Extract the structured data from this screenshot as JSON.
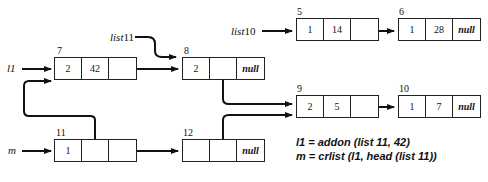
{
  "diagram": {
    "type": "linked-list-memory",
    "nodes": [
      {
        "id": "n5",
        "address": "5",
        "cells": [
          "1",
          "14",
          ""
        ],
        "x": 296,
        "y": 18
      },
      {
        "id": "n6",
        "address": "6",
        "cells": [
          "1",
          "28",
          "null"
        ],
        "x": 398,
        "y": 18
      },
      {
        "id": "n7",
        "address": "7",
        "cells": [
          "2",
          "42",
          ""
        ],
        "x": 54,
        "y": 57
      },
      {
        "id": "n8",
        "address": "8",
        "cells": [
          "2",
          "",
          "null"
        ],
        "x": 182,
        "y": 57
      },
      {
        "id": "n9",
        "address": "9",
        "cells": [
          "2",
          "5",
          ""
        ],
        "x": 296,
        "y": 95
      },
      {
        "id": "n10",
        "address": "10",
        "cells": [
          "1",
          "7",
          "null"
        ],
        "x": 398,
        "y": 95
      },
      {
        "id": "n11",
        "address": "11",
        "cells": [
          "1",
          "",
          ""
        ],
        "x": 54,
        "y": 139
      },
      {
        "id": "n12",
        "address": "12",
        "cells": [
          "",
          "",
          "null"
        ],
        "x": 182,
        "y": 139
      }
    ],
    "variables": [
      {
        "id": "l1",
        "label": "l1",
        "points_to": "n7"
      },
      {
        "id": "m",
        "label": "m",
        "points_to": "n11"
      },
      {
        "id": "list11",
        "label": "list11",
        "points_to": "n8"
      },
      {
        "id": "list10",
        "label": "list10",
        "points_to": "n5"
      }
    ],
    "edges": [
      {
        "from": "n5.next",
        "to": "n6"
      },
      {
        "from": "n7.next",
        "to": "n8"
      },
      {
        "from": "n8.data",
        "to": "n9"
      },
      {
        "from": "n9.next",
        "to": "n10"
      },
      {
        "from": "n11.data",
        "to": "n7"
      },
      {
        "from": "n11.next",
        "to": "n12"
      },
      {
        "from": "n12.data",
        "to": "n9"
      }
    ],
    "equations": [
      "l1 = addon (list 11, 42)",
      "m = crlist (l1, head (list 11))"
    ],
    "labels": {
      "l1": "l1",
      "m": "m",
      "list11": "list",
      "list11_num": "11",
      "list10": "list",
      "list10_num": "10"
    }
  }
}
